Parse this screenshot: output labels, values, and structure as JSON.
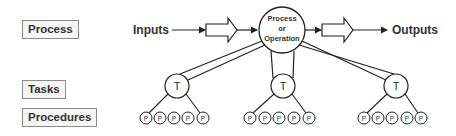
{
  "levels": {
    "process": "Process",
    "tasks": "Tasks",
    "procedures": "Procedures"
  },
  "flow": {
    "inputs": "Inputs",
    "outputs": "Outputs",
    "center_line1": "Process",
    "center_line2": "or",
    "center_line3": "Operation"
  },
  "task_symbol": "T",
  "procedure_symbol": "P",
  "tasks": [
    {
      "label": "T",
      "procedures": [
        "P",
        "P",
        "P",
        "P",
        "P"
      ]
    },
    {
      "label": "T",
      "procedures": [
        "P",
        "P",
        "P",
        "P",
        "P"
      ]
    },
    {
      "label": "T",
      "procedures": [
        "P",
        "P",
        "P",
        "P",
        "P"
      ]
    }
  ],
  "colors": {
    "stroke": "#222222",
    "label_border": "#8a8a8a",
    "label_bg": "#f5f5f5",
    "text": "#333333"
  }
}
